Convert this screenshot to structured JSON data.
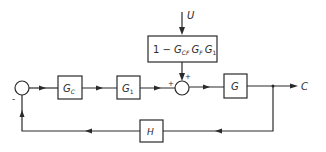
{
  "diagram": {
    "type": "control-system-block-diagram",
    "colors": {
      "line": "#2a2a2a",
      "background": "#ffffff"
    },
    "input": {
      "label": "U"
    },
    "output": {
      "label": "C"
    },
    "blocks": {
      "feedforward": {
        "prefix": "1 − ",
        "t1": "G",
        "s1": "CF",
        "t2": "G",
        "s2": "F",
        "t3": "G",
        "s3": "1"
      },
      "controller": {
        "main": "G",
        "sub": "C"
      },
      "g1": {
        "main": "G",
        "sub": "1"
      },
      "plant": {
        "main": "G"
      },
      "feedback": {
        "main": "H"
      }
    },
    "summing_junctions": {
      "error": {
        "minus_sign": "-"
      },
      "disturbance": {
        "plus_left": "+",
        "plus_top": "+"
      }
    }
  }
}
